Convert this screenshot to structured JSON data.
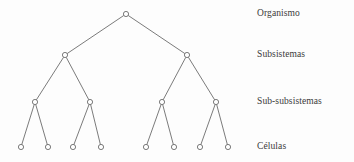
{
  "figure": {
    "type": "hierarchy-tree-diagram",
    "background_color": "#fdfdfd",
    "stroke_color": "#595959",
    "node_fill_color": "#ffffff",
    "text_color": "#3a3a3a",
    "node_radius": 2.6,
    "edge_width": 0.8
  },
  "levels": [
    {
      "label": "Organismo",
      "y": 14,
      "node_count": 1
    },
    {
      "label": "Subsistemas",
      "y": 55,
      "node_count": 2
    },
    {
      "label": "Sub-subsistemas",
      "y": 102,
      "node_count": 4
    },
    {
      "label": "Células",
      "y": 147,
      "node_count": 8
    }
  ],
  "label_column": {
    "x": 257
  },
  "nodes": [
    {
      "id": "n0",
      "level": 0,
      "x": 126,
      "y": 14
    },
    {
      "id": "n1",
      "level": 1,
      "x": 65,
      "y": 55
    },
    {
      "id": "n2",
      "level": 1,
      "x": 187,
      "y": 55
    },
    {
      "id": "n3",
      "level": 2,
      "x": 35,
      "y": 102
    },
    {
      "id": "n4",
      "level": 2,
      "x": 90,
      "y": 102
    },
    {
      "id": "n5",
      "level": 2,
      "x": 162,
      "y": 102
    },
    {
      "id": "n6",
      "level": 2,
      "x": 216,
      "y": 102
    },
    {
      "id": "n7",
      "level": 3,
      "x": 21,
      "y": 147
    },
    {
      "id": "n8",
      "level": 3,
      "x": 48,
      "y": 147
    },
    {
      "id": "n9",
      "level": 3,
      "x": 73,
      "y": 147
    },
    {
      "id": "n10",
      "level": 3,
      "x": 101,
      "y": 147
    },
    {
      "id": "n11",
      "level": 3,
      "x": 146,
      "y": 147
    },
    {
      "id": "n12",
      "level": 3,
      "x": 174,
      "y": 147
    },
    {
      "id": "n13",
      "level": 3,
      "x": 200,
      "y": 147
    },
    {
      "id": "n14",
      "level": 3,
      "x": 228,
      "y": 147
    }
  ],
  "edges": [
    {
      "from": "n0",
      "to": "n1"
    },
    {
      "from": "n0",
      "to": "n2"
    },
    {
      "from": "n1",
      "to": "n3"
    },
    {
      "from": "n1",
      "to": "n4"
    },
    {
      "from": "n2",
      "to": "n5"
    },
    {
      "from": "n2",
      "to": "n6"
    },
    {
      "from": "n3",
      "to": "n7"
    },
    {
      "from": "n3",
      "to": "n8"
    },
    {
      "from": "n4",
      "to": "n9"
    },
    {
      "from": "n4",
      "to": "n10"
    },
    {
      "from": "n5",
      "to": "n11"
    },
    {
      "from": "n5",
      "to": "n12"
    },
    {
      "from": "n6",
      "to": "n13"
    },
    {
      "from": "n6",
      "to": "n14"
    }
  ]
}
